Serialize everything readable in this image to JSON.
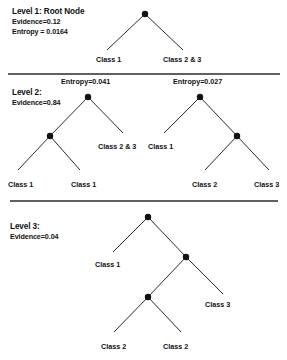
{
  "figure": {
    "background_color": "#ffffff",
    "ink_color": "#111111",
    "line_color": "#2b2b2b",
    "width": 287,
    "height": 360
  },
  "levels": [
    {
      "id": "level-1",
      "title": "Level 1: Root Node",
      "lines": [
        "Evidence=0.12",
        "Entropy = 0.0164"
      ],
      "caption_x": 12,
      "caption_y": 7,
      "annotations": [],
      "nodes": [
        {
          "name": "root",
          "x": 145,
          "y": 14,
          "r": 3.2
        }
      ],
      "edges": [
        {
          "x1": 145,
          "y1": 14,
          "x2": 107,
          "y2": 50
        },
        {
          "x1": 145,
          "y1": 14,
          "x2": 183,
          "y2": 50
        }
      ],
      "leaves": [
        {
          "label": "Class 1",
          "x": 96,
          "y": 55
        },
        {
          "label": "Class 2 &  3",
          "x": 163,
          "y": 55
        }
      ]
    },
    {
      "id": "level-2",
      "title": "Level 2:",
      "lines": [
        "Evidence=0.84"
      ],
      "caption_x": 12,
      "caption_y": 88,
      "annotations": [
        {
          "label": "Entropy=0.041",
          "x": 61,
          "y": 77
        },
        {
          "label": "Entropy=0.027",
          "x": 173,
          "y": 77
        }
      ],
      "nodes": [
        {
          "name": "left-subtree-root",
          "x": 88,
          "y": 97,
          "r": 3.2
        },
        {
          "name": "left-subtree-child",
          "x": 50,
          "y": 136,
          "r": 3.2
        },
        {
          "name": "right-subtree-root",
          "x": 200,
          "y": 97,
          "r": 3.2
        },
        {
          "name": "right-subtree-child",
          "x": 237,
          "y": 136,
          "r": 3.2
        }
      ],
      "edges": [
        {
          "x1": 88,
          "y1": 97,
          "x2": 50,
          "y2": 136
        },
        {
          "x1": 88,
          "y1": 97,
          "x2": 123,
          "y2": 133
        },
        {
          "x1": 50,
          "y1": 136,
          "x2": 18,
          "y2": 170
        },
        {
          "x1": 50,
          "y1": 136,
          "x2": 80,
          "y2": 170
        },
        {
          "x1": 200,
          "y1": 97,
          "x2": 164,
          "y2": 133
        },
        {
          "x1": 200,
          "y1": 97,
          "x2": 237,
          "y2": 136
        },
        {
          "x1": 237,
          "y1": 136,
          "x2": 205,
          "y2": 170
        },
        {
          "x1": 237,
          "y1": 136,
          "x2": 269,
          "y2": 170
        }
      ],
      "leaves": [
        {
          "label": "Class 2 &  3",
          "x": 98,
          "y": 142
        },
        {
          "label": "Class 1",
          "x": 148,
          "y": 142
        },
        {
          "label": "Class 1",
          "x": 8,
          "y": 180
        },
        {
          "label": "Class 1",
          "x": 71,
          "y": 180
        },
        {
          "label": "Class 2",
          "x": 192,
          "y": 180
        },
        {
          "label": "Class 3",
          "x": 254,
          "y": 180
        }
      ]
    },
    {
      "id": "level-3",
      "title": "Level 3:",
      "lines": [
        "Evidence=0.04"
      ],
      "caption_x": 10,
      "caption_y": 222,
      "annotations": [],
      "nodes": [
        {
          "name": "root",
          "x": 148,
          "y": 217,
          "r": 3.2
        },
        {
          "name": "right-child",
          "x": 186,
          "y": 257,
          "r": 3.2
        },
        {
          "name": "inner-child",
          "x": 148,
          "y": 297,
          "r": 3.2
        }
      ],
      "edges": [
        {
          "x1": 148,
          "y1": 217,
          "x2": 113,
          "y2": 252
        },
        {
          "x1": 148,
          "y1": 217,
          "x2": 186,
          "y2": 257
        },
        {
          "x1": 186,
          "y1": 257,
          "x2": 148,
          "y2": 297
        },
        {
          "x1": 186,
          "y1": 257,
          "x2": 223,
          "y2": 294
        },
        {
          "x1": 148,
          "y1": 297,
          "x2": 114,
          "y2": 332
        },
        {
          "x1": 148,
          "y1": 297,
          "x2": 181,
          "y2": 332
        }
      ],
      "leaves": [
        {
          "label": "Class 1",
          "x": 95,
          "y": 260
        },
        {
          "label": "Class 3",
          "x": 205,
          "y": 300
        },
        {
          "label": "Class 2",
          "x": 101,
          "y": 342
        },
        {
          "label": "Class 2",
          "x": 163,
          "y": 342
        }
      ]
    }
  ],
  "dividers": [
    {
      "name": "divider-level-1-2",
      "x1": 8,
      "y1": 74,
      "x2": 280,
      "y2": 74
    },
    {
      "name": "divider-level-2-3",
      "x1": 10,
      "y1": 201,
      "x2": 278,
      "y2": 201
    }
  ]
}
